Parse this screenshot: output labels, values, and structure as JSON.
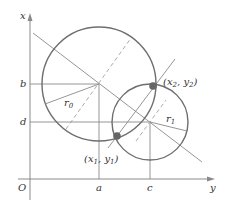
{
  "diagram": {
    "axes": {
      "vertical_label": "x",
      "horizontal_label": "y",
      "origin_label": "O"
    },
    "ticks": {
      "vertical": [
        {
          "label": "b",
          "y": 84
        },
        {
          "label": "d",
          "y": 122
        }
      ],
      "horizontal": [
        {
          "label": "a",
          "x": 99
        },
        {
          "label": "c",
          "x": 150
        }
      ]
    },
    "circles": [
      {
        "name": "circle-0",
        "center": [
          99,
          84
        ],
        "radius": 57,
        "radius_label": "r",
        "radius_sub": "0"
      },
      {
        "name": "circle-1",
        "center": [
          150,
          122
        ],
        "radius": 38,
        "radius_label": "r",
        "radius_sub": "1"
      }
    ],
    "points": [
      {
        "name": "intersection-1",
        "label_x": "x",
        "sub_x": "1",
        "label_y": "y",
        "sub_y": "1",
        "pos": [
          117,
          136
        ]
      },
      {
        "name": "intersection-2",
        "label_x": "x",
        "sub_x": "2",
        "label_y": "y",
        "sub_y": "2",
        "pos": [
          153,
          86
        ]
      }
    ],
    "colors": {
      "axis": "#8a8a8a",
      "circle": "#6e6e6e",
      "line": "#8a8a8a",
      "dashed": "#a0a0a0",
      "point": "#666666",
      "text": "#333333"
    },
    "punct": {
      "open": "(",
      "comma": ", ",
      "close": ")"
    }
  }
}
